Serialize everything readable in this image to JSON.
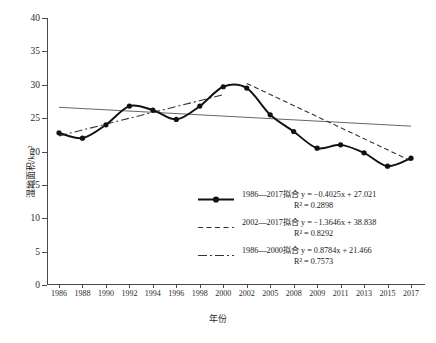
{
  "chart_data": {
    "type": "line",
    "title": "",
    "xlabel": "年份",
    "ylabel": "湿地面积/km²",
    "categories": [
      "1986",
      "1988",
      "1990",
      "1992",
      "1994",
      "1996",
      "1998",
      "2000",
      "2002",
      "2005",
      "2008",
      "2009",
      "2011",
      "2013",
      "2015",
      "2017"
    ],
    "values": [
      22.8,
      22.0,
      24.0,
      26.8,
      26.2,
      24.8,
      26.8,
      29.7,
      29.5,
      25.5,
      23.0,
      20.5,
      21.0,
      19.8,
      17.8,
      19.0
    ],
    "ylim": [
      0,
      40
    ],
    "yticks": [
      0,
      5,
      10,
      15,
      20,
      25,
      30,
      35,
      40
    ],
    "grid": false,
    "legend_position": "inside-lower-right",
    "series": [
      {
        "name": "1986—2017拟合",
        "style": "solid-with-markers",
        "equation": "y = −0.4025x + 27.021",
        "r2": "R² = 0.2898",
        "r2_value": 0.2898,
        "slope": -0.4025,
        "intercept": 27.021,
        "fit_start_value": 26.62,
        "fit_end_value": 23.8
      },
      {
        "name": "2002—2017拟合",
        "style": "dashed",
        "equation": "y = −1.3646x + 38.838",
        "r2": "R² = 0.8292",
        "r2_value": 0.8292,
        "slope": -1.3646,
        "intercept": 38.838,
        "fit_start_value": 30.2,
        "fit_end_value": 18.6
      },
      {
        "name": "1986—2000拟合",
        "style": "dash-dot",
        "equation": "y = 0.8784x + 21.466",
        "r2": "R² = 0.7573",
        "r2_value": 0.7573,
        "slope": 0.8784,
        "intercept": 21.466,
        "fit_start_value": 22.34,
        "fit_end_value": 28.5
      }
    ]
  },
  "legend": {
    "entries": [
      {
        "label": "1986—2017拟合 y = −0.4025x + 27.021",
        "r2": "R² = 0.2898"
      },
      {
        "label": "2002—2017拟合 y = −1.3646x + 38.838",
        "r2": "R² = 0.8292"
      },
      {
        "label": "1986—2000拟合 y = 0.8784x + 21.466",
        "r2": "R² = 0.7573"
      }
    ]
  },
  "colors": {
    "line": "#111111",
    "axis": "#4a4a4a",
    "text": "#2b2b2b",
    "trend": "#555555"
  }
}
